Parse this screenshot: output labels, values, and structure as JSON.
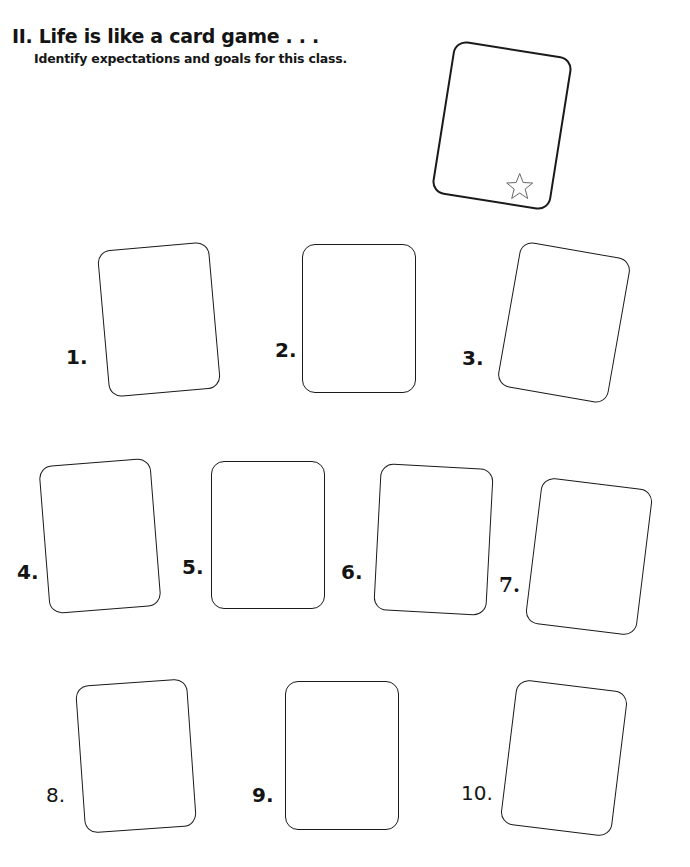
{
  "worksheet": {
    "title": "II. Life is like a card game . . .",
    "subtitle": "Identify expectations and goals for this class."
  },
  "example_card": {
    "icon": "star-icon",
    "stroke_color": "#1a1a1a",
    "icon_color": "#666666"
  },
  "cards": [
    {
      "label": "1."
    },
    {
      "label": "2."
    },
    {
      "label": "3."
    },
    {
      "label": "4."
    },
    {
      "label": "5."
    },
    {
      "label": "6."
    },
    {
      "label": "7."
    },
    {
      "label": "8."
    },
    {
      "label": "9."
    },
    {
      "label": "10."
    }
  ]
}
